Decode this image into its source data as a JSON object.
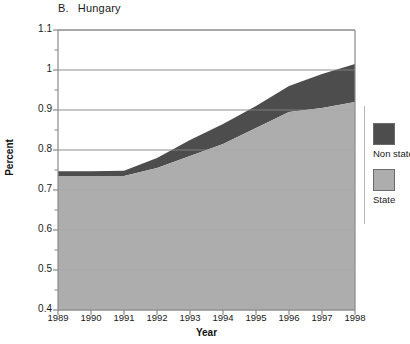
{
  "panel": {
    "letter": "B.",
    "name": "Hungary"
  },
  "legend": {
    "position": "right",
    "entries": [
      {
        "label": "Non state",
        "color": "#4d4d4d"
      },
      {
        "label": "State",
        "color": "#adadad"
      }
    ]
  },
  "colors": {
    "state": "#adadad",
    "non_state": "#4d4d4d",
    "grid": "#a8a8a8",
    "axis": "#8a8a8a",
    "text": "#1a1a1a"
  },
  "chart_data": {
    "type": "area",
    "stacked": true,
    "xlabel": "Year",
    "ylabel": "Percent",
    "xlim": [
      1989,
      1998
    ],
    "ylim": [
      0.4,
      1.1
    ],
    "ytick_step": 0.1,
    "yminor_step": 0.05,
    "grid": true,
    "legend_position": "right",
    "x": [
      1989,
      1990,
      1991,
      1992,
      1993,
      1994,
      1995,
      1996,
      1997,
      1998
    ],
    "categories": [
      "1989",
      "1990",
      "1991",
      "1992",
      "1993",
      "1994",
      "1995",
      "1996",
      "1997",
      "1998"
    ],
    "ytick_labels": [
      "0.4",
      "0.5",
      "0.6",
      "0.7",
      "0.8",
      "0.9",
      "1",
      "1.1"
    ],
    "ytick_values": [
      0.4,
      0.5,
      0.6,
      0.7,
      0.8,
      0.9,
      1.0,
      1.1
    ],
    "series": [
      {
        "name": "State",
        "color": "#adadad",
        "values": [
          0.735,
          0.735,
          0.735,
          0.755,
          0.785,
          0.815,
          0.855,
          0.895,
          0.905,
          0.92
        ]
      },
      {
        "name": "Non state",
        "color": "#4d4d4d",
        "values": [
          0.012,
          0.012,
          0.013,
          0.025,
          0.04,
          0.05,
          0.055,
          0.065,
          0.085,
          0.095
        ]
      }
    ],
    "totals": [
      0.747,
      0.747,
      0.748,
      0.78,
      0.825,
      0.865,
      0.91,
      0.96,
      0.99,
      1.015
    ]
  }
}
